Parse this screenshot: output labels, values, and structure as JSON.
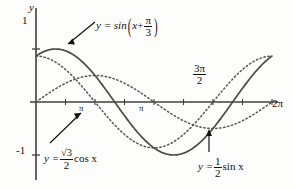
{
  "figure": {
    "background_color": "#fdfdfc",
    "ink_color": "#3a3a3a",
    "text_color": "#121212"
  },
  "axes": {
    "y_axis_label": "y",
    "y_tick_top": "1",
    "y_tick_bottom": "-1",
    "x_tick_labels": [
      {
        "name": "pi-over-2",
        "text_num": "π",
        "text_den": "2",
        "simple": "π"
      },
      {
        "name": "pi",
        "text": "π"
      },
      {
        "name": "three-pi-over-2",
        "num": "3π",
        "den": "2"
      },
      {
        "name": "two-pi",
        "text": "2π"
      }
    ],
    "x_min_label": "0",
    "x_max_label": "2π"
  },
  "labels": {
    "main_curve": {
      "lhs": "y = sin",
      "arg_var": "x",
      "plus": "+",
      "frac_num": "π",
      "frac_den": "3"
    },
    "cos_curve": {
      "lhs": "y =",
      "radical": "√3",
      "frac_den": "2",
      "trailing": "cos x"
    },
    "half_sin_curve": {
      "lhs": "y =",
      "frac_num": "1",
      "frac_den": "2",
      "trailing": "sin x"
    },
    "three_pi_over_two": {
      "num": "3π",
      "den": "2"
    },
    "two_pi": "2π",
    "pi": "π",
    "pi_half": "π",
    "y_axis": "y",
    "one": "1",
    "negative_one": "-1"
  },
  "chart_data": {
    "type": "line",
    "title": "",
    "xlabel": "",
    "ylabel": "y",
    "xlim": [
      0,
      6.283185307179586
    ],
    "ylim": [
      -1.15,
      1.15
    ],
    "grid": false,
    "legend": "annotations",
    "x_ticks": [
      1.5707963268,
      3.1415926536,
      4.7123889804,
      6.2831853072
    ],
    "x_tick_labels": [
      "π",
      "π",
      "3π/2",
      "2π"
    ],
    "y_ticks": [
      -1,
      1
    ],
    "y_tick_labels": [
      "-1",
      "1"
    ],
    "series": [
      {
        "name": "y = sin(x + π/3)",
        "style": "solid",
        "color": "#4a4a4a",
        "amplitude": 1.0,
        "phase": 1.0471975512,
        "function": "sin",
        "label_position": "top-center",
        "has_leader_arrow": true
      },
      {
        "name": "y = (√3/2) cos x",
        "style": "dotted",
        "color": "#555555",
        "amplitude": 0.8660254038,
        "phase": 1.5707963268,
        "function": "sin",
        "label_position": "bottom-left",
        "has_leader_arrow": true
      },
      {
        "name": "y = (1/2) sin x",
        "style": "dotted",
        "color": "#555555",
        "amplitude": 0.5,
        "phase": 0.0,
        "function": "sin",
        "label_position": "bottom-right",
        "has_leader_arrow": true
      }
    ]
  },
  "geometry": {
    "origin_x": 36,
    "origin_y": 102,
    "x_scale": 37.56,
    "y_scale": 53,
    "axis_right": 278,
    "axis_top": 8,
    "axis_bottom": 180
  }
}
